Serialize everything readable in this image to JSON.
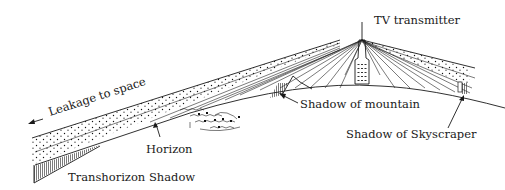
{
  "diagram": {
    "labels": {
      "transmitter": "TV transmitter",
      "leakage": "Leakage to space",
      "horizon": "Horizon",
      "transhorizon": "Transhorizon  Shadow",
      "mountain": "Shadow of mountain",
      "skyscraper": "Shadow of Skyscraper"
    },
    "colors": {
      "ink": "#1a1a1a",
      "background": "#ffffff"
    }
  }
}
